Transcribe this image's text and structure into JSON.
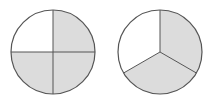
{
  "figures": [
    {
      "label": "circle divided into 4 equal parts",
      "parts": 4,
      "shaded": 3,
      "fraction": "3/4",
      "center": [
        53,
        52
      ],
      "radius": 42,
      "shaded_sectors": [
        "top-right",
        "bottom-left",
        "bottom-right"
      ],
      "unshaded_sectors": [
        "top-left"
      ]
    },
    {
      "label": "circle divided into 3 equal parts",
      "parts": 3,
      "shaded": 2,
      "fraction": "2/3",
      "center": [
        160,
        52
      ],
      "radius": 42,
      "shaded_sectors": [
        "right",
        "bottom"
      ],
      "unshaded_sectors": [
        "left"
      ]
    }
  ],
  "colors": {
    "shade": "#dcdcdc",
    "blank": "#ffffff",
    "stroke": "#555555"
  }
}
